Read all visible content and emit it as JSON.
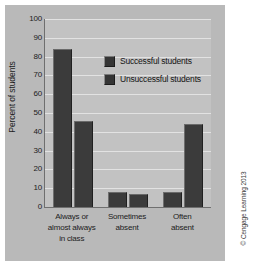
{
  "chart_data": {
    "type": "bar",
    "title": "",
    "xlabel": "",
    "ylabel": "Percent of students",
    "ylim": [
      0,
      100
    ],
    "ytick_step": 10,
    "grid": true,
    "legend_position": "inside-top-right",
    "categories": [
      "Always or\nalmost always\nin class",
      "Sometimes\nabsent",
      "Often\nabsent"
    ],
    "category_lines": [
      [
        "Always or",
        "almost always",
        "in class"
      ],
      [
        "Sometimes",
        "absent"
      ],
      [
        "Often",
        "absent"
      ]
    ],
    "yticks": [
      "0",
      "10",
      "20",
      "30",
      "40",
      "50",
      "60",
      "70",
      "80",
      "90",
      "100"
    ],
    "series": [
      {
        "name": "Successful students",
        "values": [
          84,
          8,
          8
        ],
        "color": "#3b3b3b"
      },
      {
        "name": "Unsuccessful students",
        "values": [
          46,
          7,
          44
        ],
        "color": "#3b3b3b"
      }
    ]
  },
  "legend": {
    "entries": [
      {
        "label": "Successful students",
        "swatch": "#353535"
      },
      {
        "label": "Unsuccessful students",
        "swatch": "#353535"
      }
    ]
  },
  "credits": {
    "copyright": "© Cengage Learning 2013"
  },
  "colors": {
    "panel_background": "#b9b9b9",
    "plot_background": "#c2c2c2",
    "bar": "#3b3b3b",
    "gridline": "#e2e2e2",
    "axis": "#6f6f6f",
    "text": "#1c1c1c"
  }
}
